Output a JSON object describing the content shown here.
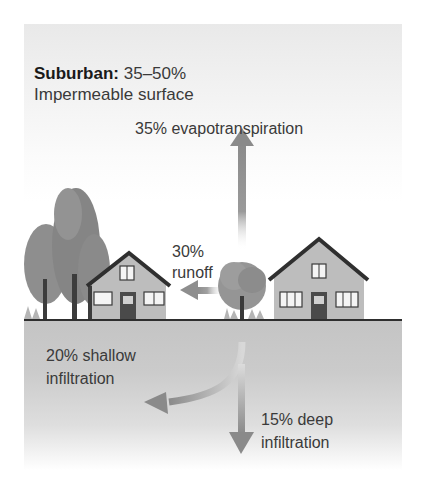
{
  "header": {
    "title_bold": "Suburban:",
    "title_value": "35–50%",
    "subtitle": "Impermeable surface"
  },
  "flows": {
    "evapotranspiration": "35% evapotranspiration",
    "runoff_pct": "30%",
    "runoff_label": "runoff",
    "shallow_pct_label": "20% shallow",
    "shallow_label": "infiltration",
    "deep_pct_label": "15% deep",
    "deep_label": "infiltration"
  },
  "colors": {
    "arrow": "#8c8c8c",
    "text": "#3a3a3a",
    "house_wall": "#bdbdbd",
    "roof": "#333333",
    "tree": "#8f8f8f",
    "soil": "#c8c8c8"
  }
}
